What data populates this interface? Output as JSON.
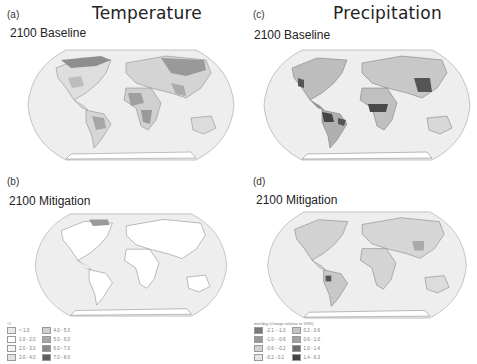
{
  "columns": {
    "left": {
      "title": "Temperature"
    },
    "right": {
      "title": "Precipitation"
    }
  },
  "panels": {
    "a": {
      "letter": "(a)",
      "scenario": "2100 Baseline",
      "variable": "Temperature"
    },
    "b": {
      "letter": "(b)",
      "scenario": "2100 Mitigation",
      "variable": "Temperature"
    },
    "c": {
      "letter": "(c)",
      "scenario": "2100 Baseline",
      "variable": "Precipitation"
    },
    "d": {
      "letter": "(d)",
      "scenario": "2100 Mitigation",
      "variable": "Precipitation"
    }
  },
  "legends": {
    "temperature": {
      "unit": "°C",
      "items": [
        {
          "label": "< 1.0",
          "color": "#e9e9e9"
        },
        {
          "label": "1.0 - 2.0",
          "color": "#ffffff"
        },
        {
          "label": "2.0 - 3.0",
          "color": "#f4f4f4"
        },
        {
          "label": "3.0 - 4.0",
          "color": "#e2e2e2"
        },
        {
          "label": "4.0 - 5.0",
          "color": "#cfcfcf"
        },
        {
          "label": "5.0 - 6.0",
          "color": "#a9a9a9"
        },
        {
          "label": "6.0 - 7.0",
          "color": "#8a8a8a"
        },
        {
          "label": "7.0 - 8.0",
          "color": "#5e5e5e"
        }
      ]
    },
    "precipitation": {
      "unit": "mm/day (change relative to 1990)",
      "items": [
        {
          "label": "-2.1 - -1.0",
          "color": "#7a7a7a"
        },
        {
          "label": "-1.0 - -0.6",
          "color": "#9a9a9a"
        },
        {
          "label": "-0.6 - -0.2",
          "color": "#d2d2d2"
        },
        {
          "label": "-0.2 - 0.2",
          "color": "#e6e6e6"
        },
        {
          "label": "0.2 - 0.6",
          "color": "#c4c4c4"
        },
        {
          "label": "0.6 - 1.0",
          "color": "#a2a2a2"
        },
        {
          "label": "1.0 - 1.4",
          "color": "#6e6e6e"
        },
        {
          "label": "1.4 - 6.3",
          "color": "#444444"
        }
      ]
    }
  },
  "colors": {
    "ocean": "#eeeeee",
    "border": "#b5b5b5",
    "coast": "#555555"
  }
}
